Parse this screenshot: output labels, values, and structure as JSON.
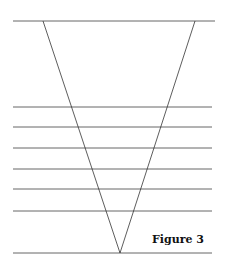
{
  "figure": {
    "caption": "Figure 3",
    "horizontal_line_count": 8,
    "shape": "inverted triangle (V) crossing a set of horizontal parallel lines",
    "colors": {
      "line": "#555555",
      "v_line": "#333333",
      "text": "#111111",
      "background": "#ffffff"
    }
  }
}
